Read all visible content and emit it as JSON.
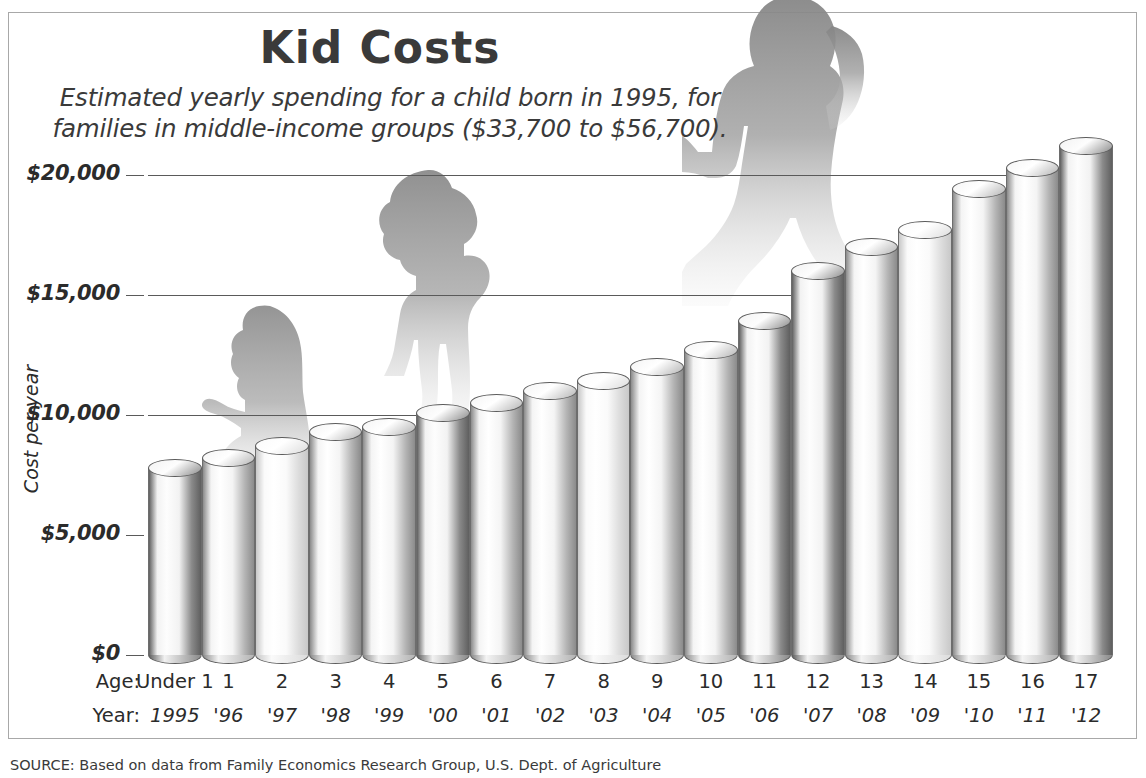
{
  "header": {
    "title": "Kid Costs",
    "subtitle_line1": "Estimated yearly spending for a child born in 1995, for",
    "subtitle_line2": "families in middle-income groups ($33,700 to $56,700)."
  },
  "axis": {
    "y_title": "Cost per year",
    "age_row_label": "Age:",
    "year_row_label": "Year:"
  },
  "source": "SOURCE: Based on data from Family Economics Research Group, U.S. Dept. of Agriculture",
  "colors": {
    "frame": "#a8a8a8",
    "gridline": "#5a5a5a",
    "text": "#2b2b2b",
    "bar_outline": "#5c5c5c",
    "bar_light": "#fbfbfb",
    "bar_dark": "#6f6f6f",
    "silhouette": "#9a9a9a"
  },
  "chart_data": {
    "type": "bar",
    "title": "Kid Costs",
    "subtitle": "Estimated yearly spending for a child born in 1995, for families in middle-income groups ($33,700 to $56,700).",
    "xlabel": "Age / Year",
    "ylabel": "Cost per year",
    "ylim": [
      0,
      21500
    ],
    "ytick_values": [
      0,
      5000,
      10000,
      15000,
      20000
    ],
    "ytick_labels": [
      "$0",
      "$5,000",
      "$10,000",
      "$15,000",
      "$20,000"
    ],
    "grid": true,
    "legend": "none",
    "categories": [
      "Under 1",
      "1",
      "2",
      "3",
      "4",
      "5",
      "6",
      "7",
      "8",
      "9",
      "10",
      "11",
      "12",
      "13",
      "14",
      "15",
      "16",
      "17"
    ],
    "years": [
      "1995",
      "'96",
      "'97",
      "'98",
      "'99",
      "'00",
      "'01",
      "'02",
      "'03",
      "'04",
      "'05",
      "'06",
      "'07",
      "'08",
      "'09",
      "'10",
      "'11",
      "'12"
    ],
    "values": [
      7800,
      8200,
      8700,
      9300,
      9500,
      10100,
      10500,
      11000,
      11400,
      12000,
      12700,
      13900,
      16000,
      17000,
      17700,
      19400,
      20300,
      21200
    ],
    "annotations": [
      "crawling-baby-silhouette",
      "toddler-silhouette",
      "teenager-with-backpack-silhouette"
    ]
  }
}
